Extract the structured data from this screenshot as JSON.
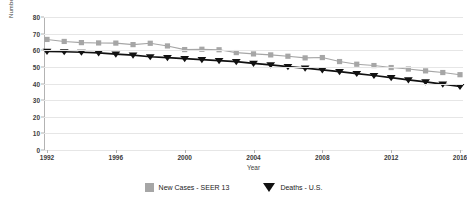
{
  "chart_data": {
    "type": "line",
    "title": "",
    "xlabel": "Year",
    "ylabel": "Number Per 100,000 Persons",
    "ylim": [
      0,
      80
    ],
    "xlim": [
      1992,
      2016
    ],
    "y_ticks": [
      0,
      10,
      20,
      30,
      40,
      50,
      60,
      70,
      80
    ],
    "x_ticks": [
      1992,
      1996,
      2000,
      2004,
      2008,
      2012,
      2016
    ],
    "grid": true,
    "legend_position": "bottom",
    "x": [
      1992,
      1993,
      1994,
      1995,
      1996,
      1997,
      1998,
      1999,
      2000,
      2001,
      2002,
      2003,
      2004,
      2005,
      2006,
      2007,
      2008,
      2009,
      2010,
      2011,
      2012,
      2013,
      2014,
      2015,
      2016
    ],
    "series": [
      {
        "name": "New Cases - SEER 13",
        "color": "#a6a6a6",
        "marker": "square",
        "values": [
          66.5,
          65.3,
          64.6,
          64.4,
          64.3,
          63.4,
          64.2,
          62.6,
          60.4,
          60.6,
          60.3,
          58.6,
          57.8,
          57.2,
          56.4,
          55.4,
          55.6,
          53.2,
          51.6,
          50.8,
          49.6,
          48.7,
          47.6,
          46.6,
          45.3
        ]
      },
      {
        "name": "Deaths - U.S.",
        "color": "#111111",
        "marker": "triangle-down",
        "values": [
          59.3,
          59.1,
          58.8,
          58.4,
          57.7,
          57.1,
          56.1,
          55.6,
          55.0,
          54.4,
          53.8,
          53.1,
          52.1,
          51.2,
          50.2,
          49.2,
          48.2,
          47.1,
          46.0,
          44.8,
          43.5,
          42.2,
          41.0,
          39.6,
          38.2
        ]
      }
    ]
  },
  "axes": {
    "y_title": "Number Per 100,000 Persons",
    "x_title": "Year"
  },
  "legend": {
    "items": [
      {
        "label": "New Cases - SEER 13",
        "marker": "square",
        "color": "#a6a6a6"
      },
      {
        "label": "Deaths - U.S.",
        "marker": "triangle-down",
        "color": "#111111"
      }
    ]
  }
}
